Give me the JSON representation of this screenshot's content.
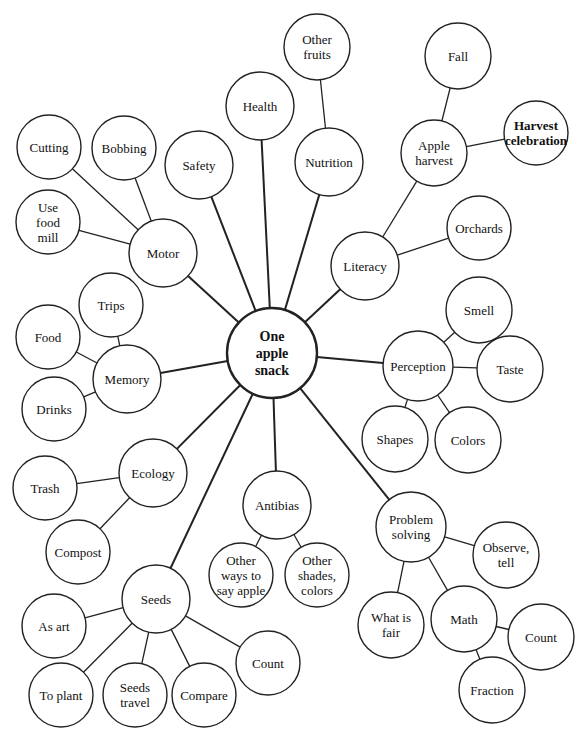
{
  "diagram": {
    "type": "web-planning-diagram",
    "center": {
      "id": "center",
      "label": [
        "One",
        "apple",
        "snack"
      ],
      "x": 272,
      "y": 353,
      "r": 45
    },
    "nodes": [
      {
        "id": "safety",
        "label": [
          "Safety"
        ],
        "x": 199,
        "y": 165,
        "r": 34,
        "parent": "center"
      },
      {
        "id": "health",
        "label": [
          "Health"
        ],
        "x": 260,
        "y": 106,
        "r": 34,
        "parent": "center"
      },
      {
        "id": "other-fruits",
        "label": [
          "Other",
          "fruits"
        ],
        "x": 317,
        "y": 47,
        "r": 33,
        "parent": "nutrition"
      },
      {
        "id": "nutrition",
        "label": [
          "Nutrition"
        ],
        "x": 329,
        "y": 162,
        "r": 34,
        "parent": "center"
      },
      {
        "id": "fall",
        "label": [
          "Fall"
        ],
        "x": 458,
        "y": 56,
        "r": 33,
        "parent": "apple-harvest"
      },
      {
        "id": "apple-harvest",
        "label": [
          "Apple",
          "harvest"
        ],
        "x": 434,
        "y": 153,
        "r": 33,
        "parent": "literacy"
      },
      {
        "id": "harvest-celebration",
        "label": [
          "Harvest",
          "celebration"
        ],
        "x": 536,
        "y": 133,
        "r": 32,
        "parent": "apple-harvest",
        "bold": true
      },
      {
        "id": "literacy",
        "label": [
          "Literacy"
        ],
        "x": 365,
        "y": 266,
        "r": 34,
        "parent": "center"
      },
      {
        "id": "orchards",
        "label": [
          "Orchards"
        ],
        "x": 479,
        "y": 228,
        "r": 32,
        "parent": "literacy"
      },
      {
        "id": "perception",
        "label": [
          "Perception"
        ],
        "x": 418,
        "y": 366,
        "r": 35,
        "parent": "center"
      },
      {
        "id": "smell",
        "label": [
          "Smell"
        ],
        "x": 479,
        "y": 310,
        "r": 33,
        "parent": "perception"
      },
      {
        "id": "taste",
        "label": [
          "Taste"
        ],
        "x": 510,
        "y": 369,
        "r": 33,
        "parent": "perception"
      },
      {
        "id": "shapes",
        "label": [
          "Shapes"
        ],
        "x": 395,
        "y": 439,
        "r": 33,
        "parent": "perception"
      },
      {
        "id": "colors",
        "label": [
          "Colors"
        ],
        "x": 468,
        "y": 440,
        "r": 33,
        "parent": "perception"
      },
      {
        "id": "problem-solving",
        "label": [
          "Problem",
          "solving"
        ],
        "x": 411,
        "y": 527,
        "r": 35,
        "parent": "center"
      },
      {
        "id": "observe-tell",
        "label": [
          "Observe,",
          "tell"
        ],
        "x": 506,
        "y": 555,
        "r": 33,
        "parent": "problem-solving"
      },
      {
        "id": "what-is-fair",
        "label": [
          "What is",
          "fair"
        ],
        "x": 391,
        "y": 625,
        "r": 33,
        "parent": "problem-solving"
      },
      {
        "id": "math",
        "label": [
          "Math"
        ],
        "x": 464,
        "y": 619,
        "r": 33,
        "parent": "problem-solving"
      },
      {
        "id": "count-math",
        "label": [
          "Count"
        ],
        "x": 541,
        "y": 637,
        "r": 33,
        "parent": "math"
      },
      {
        "id": "fraction",
        "label": [
          "Fraction"
        ],
        "x": 492,
        "y": 690,
        "r": 33,
        "parent": "math"
      },
      {
        "id": "antibias",
        "label": [
          "Antibias"
        ],
        "x": 277,
        "y": 505,
        "r": 34,
        "parent": "center"
      },
      {
        "id": "other-ways",
        "label": [
          "Other",
          "ways to",
          "say apple"
        ],
        "x": 241,
        "y": 575,
        "r": 32,
        "parent": "antibias"
      },
      {
        "id": "other-shades",
        "label": [
          "Other",
          "shades,",
          "colors"
        ],
        "x": 317,
        "y": 575,
        "r": 32,
        "parent": "antibias"
      },
      {
        "id": "seeds",
        "label": [
          "Seeds"
        ],
        "x": 156,
        "y": 599,
        "r": 34,
        "parent": "center"
      },
      {
        "id": "as-art",
        "label": [
          "As art"
        ],
        "x": 54,
        "y": 626,
        "r": 32,
        "parent": "seeds"
      },
      {
        "id": "to-plant",
        "label": [
          "To plant"
        ],
        "x": 61,
        "y": 695,
        "r": 32,
        "parent": "seeds"
      },
      {
        "id": "seeds-travel",
        "label": [
          "Seeds",
          "travel"
        ],
        "x": 135,
        "y": 695,
        "r": 32,
        "parent": "seeds"
      },
      {
        "id": "compare",
        "label": [
          "Compare"
        ],
        "x": 204,
        "y": 695,
        "r": 32,
        "parent": "seeds"
      },
      {
        "id": "count-seeds",
        "label": [
          "Count"
        ],
        "x": 268,
        "y": 663,
        "r": 32,
        "parent": "seeds"
      },
      {
        "id": "ecology",
        "label": [
          "Ecology"
        ],
        "x": 153,
        "y": 473,
        "r": 34,
        "parent": "center"
      },
      {
        "id": "trash",
        "label": [
          "Trash"
        ],
        "x": 45,
        "y": 488,
        "r": 32,
        "parent": "ecology"
      },
      {
        "id": "compost",
        "label": [
          "Compost"
        ],
        "x": 78,
        "y": 552,
        "r": 32,
        "parent": "ecology"
      },
      {
        "id": "memory",
        "label": [
          "Memory"
        ],
        "x": 127,
        "y": 379,
        "r": 34,
        "parent": "center"
      },
      {
        "id": "trips",
        "label": [
          "Trips"
        ],
        "x": 111,
        "y": 305,
        "r": 32,
        "parent": "memory"
      },
      {
        "id": "food",
        "label": [
          "Food"
        ],
        "x": 48,
        "y": 337,
        "r": 32,
        "parent": "memory"
      },
      {
        "id": "drinks",
        "label": [
          "Drinks"
        ],
        "x": 54,
        "y": 409,
        "r": 32,
        "parent": "memory"
      },
      {
        "id": "motor",
        "label": [
          "Motor"
        ],
        "x": 163,
        "y": 253,
        "r": 34,
        "parent": "center"
      },
      {
        "id": "cutting",
        "label": [
          "Cutting"
        ],
        "x": 49,
        "y": 147,
        "r": 32,
        "parent": "motor"
      },
      {
        "id": "bobbing",
        "label": [
          "Bobbing"
        ],
        "x": 124,
        "y": 148,
        "r": 32,
        "parent": "motor"
      },
      {
        "id": "use-food-mill",
        "label": [
          "Use",
          "food",
          "mill"
        ],
        "x": 48,
        "y": 222,
        "r": 32,
        "parent": "motor"
      }
    ]
  }
}
